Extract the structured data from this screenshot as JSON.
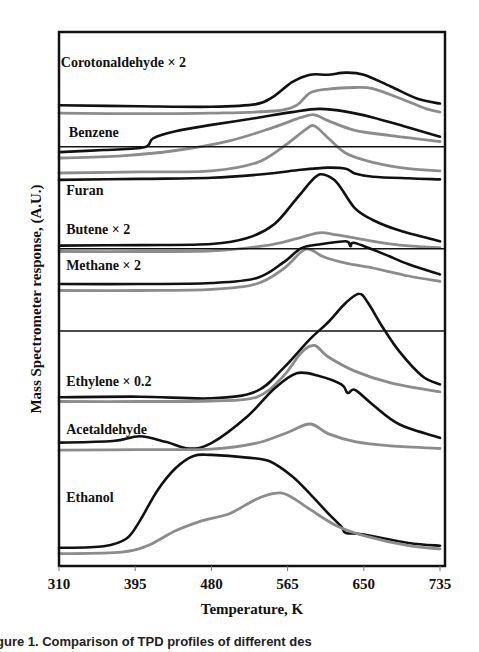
{
  "chart_data": {
    "type": "line",
    "title": "",
    "xlabel": "Temperature, K",
    "ylabel": "Mass Spectrometer response, (A.U.)",
    "xlim": [
      310,
      735
    ],
    "ylim": [
      0,
      100
    ],
    "xticks": [
      310,
      395,
      480,
      565,
      650,
      735
    ],
    "grid": false,
    "legend": "none",
    "caption": "gure 1.  Comparison  of  TPD  profiles  of  different  des",
    "series_colors": {
      "black": "#111111",
      "grey": "#8c8c8c"
    },
    "panel_separators": [
      78.5,
      59.4,
      44.0
    ],
    "annotations": [
      {
        "text": "Corotonaldehyde × 2",
        "x": 312,
        "y": 93.5
      },
      {
        "text": "Benzene",
        "x": 321,
        "y": 80.3
      },
      {
        "text": "Furan",
        "x": 318,
        "y": 69.5
      },
      {
        "text": "Butene × 2",
        "x": 318,
        "y": 62.2
      },
      {
        "text": "Methane  × 2",
        "x": 318,
        "y": 55.4
      },
      {
        "text": "Ethylene × 0.2",
        "x": 318,
        "y": 33.7
      },
      {
        "text": "Acetaldehyde",
        "x": 318,
        "y": 24.8
      },
      {
        "text": "Ethanol",
        "x": 318,
        "y": 12.0
      }
    ],
    "series": [
      {
        "name": "Corotonaldehyde × 2 (black)",
        "color": "black",
        "x": [
          310,
          400,
          480,
          530,
          550,
          570,
          590,
          610,
          630,
          650,
          680,
          710,
          735
        ],
        "y": [
          86.3,
          86.1,
          86.0,
          86.5,
          88.0,
          90.6,
          92.0,
          92.0,
          92.4,
          92.0,
          89.8,
          87.5,
          86.6
        ]
      },
      {
        "name": "Corotonaldehyde × 2 (grey)",
        "color": "grey",
        "x": [
          310,
          400,
          480,
          550,
          575,
          590,
          610,
          640,
          660,
          690,
          720,
          735
        ],
        "y": [
          84.8,
          84.7,
          84.8,
          85.2,
          86.3,
          88.6,
          89.3,
          89.6,
          89.4,
          87.6,
          85.6,
          85.0
        ]
      },
      {
        "name": "Benzene (black)",
        "color": "black",
        "x": [
          310,
          360,
          405,
          415,
          440,
          480,
          530,
          570,
          600,
          630,
          660,
          700,
          735
        ],
        "y": [
          77.5,
          77.9,
          78.4,
          80.1,
          81.4,
          82.6,
          83.9,
          85.0,
          85.6,
          85.1,
          84.0,
          82.1,
          80.4
        ]
      },
      {
        "name": "Benzene (grey)",
        "color": "grey",
        "x": [
          310,
          380,
          440,
          500,
          550,
          580,
          595,
          610,
          640,
          680,
          735
        ],
        "y": [
          76.4,
          76.8,
          77.8,
          79.6,
          82.2,
          84.0,
          84.5,
          83.4,
          81.6,
          80.6,
          79.5
        ]
      },
      {
        "name": "Benzene baseline (grey)",
        "color": "grey",
        "x": [
          310,
          400,
          480,
          530,
          560,
          585,
          595,
          610,
          630,
          660,
          700,
          735
        ],
        "y": [
          73.6,
          73.8,
          74.0,
          75.5,
          78.5,
          81.7,
          82.4,
          80.2,
          77.3,
          75.6,
          74.4,
          74.0
        ]
      },
      {
        "name": "Benzene/Furan separator (black)",
        "color": "black",
        "x": [
          310,
          400,
          480,
          540,
          580,
          610,
          630,
          640,
          660,
          700,
          735
        ],
        "y": [
          72.3,
          72.5,
          72.7,
          73.4,
          74.2,
          74.6,
          74.4,
          73.5,
          72.9,
          72.6,
          72.4
        ]
      },
      {
        "name": "Furan (black)",
        "color": "black",
        "x": [
          310,
          400,
          480,
          520,
          550,
          575,
          595,
          605,
          620,
          640,
          660,
          690,
          735
        ],
        "y": [
          60.0,
          60.1,
          60.3,
          61.4,
          64.0,
          68.8,
          72.7,
          73.3,
          71.8,
          67.0,
          64.8,
          62.8,
          60.8
        ]
      },
      {
        "name": "Butene × 2 (grey)",
        "color": "grey",
        "x": [
          310,
          400,
          480,
          540,
          575,
          600,
          620,
          650,
          690,
          735
        ],
        "y": [
          58.9,
          58.9,
          59.0,
          60.0,
          61.3,
          62.4,
          62.0,
          61.1,
          60.1,
          59.6
        ]
      },
      {
        "name": "Methane × 2 (black)",
        "color": "black",
        "x": [
          310,
          400,
          480,
          530,
          560,
          580,
          600,
          630,
          635,
          640,
          670,
          700,
          735
        ],
        "y": [
          52.8,
          52.8,
          53.0,
          53.9,
          56.8,
          59.5,
          60.2,
          60.8,
          59.9,
          60.5,
          58.6,
          56.5,
          54.6
        ]
      },
      {
        "name": "Methane × 2 (grey)",
        "color": "grey",
        "x": [
          310,
          400,
          480,
          530,
          560,
          580,
          590,
          605,
          630,
          660,
          700,
          735
        ],
        "y": [
          51.6,
          51.6,
          51.8,
          52.8,
          55.6,
          58.8,
          59.3,
          57.9,
          56.7,
          55.8,
          54.3,
          53.3
        ]
      },
      {
        "name": "Ethylene × 0.2 (black)",
        "color": "black",
        "x": [
          310,
          400,
          480,
          530,
          560,
          590,
          610,
          630,
          645,
          655,
          670,
          690,
          715,
          735
        ],
        "y": [
          31.6,
          31.7,
          31.4,
          32.7,
          37.0,
          42.5,
          45.6,
          49.3,
          51.0,
          49.2,
          45.0,
          40.1,
          35.6,
          34.0
        ]
      },
      {
        "name": "Ethylene × 0.2 (grey)",
        "color": "grey",
        "x": [
          310,
          400,
          480,
          530,
          560,
          580,
          595,
          610,
          640,
          680,
          735
        ],
        "y": [
          30.8,
          30.8,
          30.9,
          31.6,
          35.5,
          39.9,
          41.3,
          39.2,
          36.5,
          34.3,
          32.6
        ]
      },
      {
        "name": "Acetaldehyde (black)",
        "color": "black",
        "x": [
          310,
          370,
          400,
          430,
          455,
          480,
          520,
          550,
          575,
          600,
          625,
          632,
          640,
          660,
          690,
          735
        ],
        "y": [
          23.1,
          23.4,
          24.3,
          23.2,
          22.0,
          23.0,
          28.0,
          33.2,
          36.1,
          35.6,
          34.0,
          32.4,
          33.0,
          30.2,
          26.5,
          24.0
        ]
      },
      {
        "name": "Acetaldehyde (grey)",
        "color": "grey",
        "x": [
          310,
          400,
          480,
          530,
          565,
          590,
          610,
          640,
          680,
          735
        ],
        "y": [
          21.7,
          21.8,
          21.9,
          23.0,
          25.0,
          26.6,
          24.8,
          23.3,
          22.5,
          22.0
        ]
      },
      {
        "name": "Ethanol (black)",
        "color": "black",
        "x": [
          310,
          360,
          385,
          400,
          420,
          440,
          460,
          480,
          520,
          545,
          570,
          590,
          610,
          625,
          630,
          650,
          700,
          735
        ],
        "y": [
          3.4,
          3.7,
          5.1,
          8.4,
          14.2,
          18.3,
          20.6,
          20.8,
          20.3,
          19.6,
          16.8,
          13.5,
          9.9,
          7.4,
          6.2,
          5.9,
          4.3,
          3.8
        ]
      },
      {
        "name": "Ethanol (grey)",
        "color": "grey",
        "x": [
          310,
          380,
          410,
          440,
          470,
          500,
          530,
          550,
          565,
          590,
          620,
          650,
          700,
          735
        ],
        "y": [
          2.3,
          2.6,
          3.9,
          6.6,
          8.5,
          9.8,
          12.5,
          13.6,
          13.3,
          10.6,
          7.5,
          5.7,
          3.8,
          3.2
        ]
      }
    ]
  }
}
